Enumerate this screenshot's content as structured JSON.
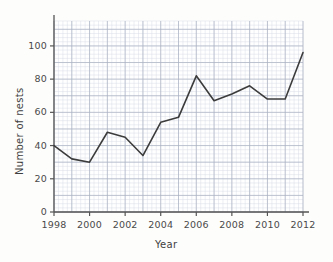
{
  "chart_data": {
    "type": "line",
    "title": "",
    "xlabel": "Year",
    "ylabel": "Number of nests",
    "x": [
      1998,
      1999,
      2000,
      2001,
      2002,
      2003,
      2004,
      2005,
      2006,
      2007,
      2008,
      2009,
      2010,
      2011,
      2012
    ],
    "values": [
      40,
      32,
      30,
      48,
      45,
      34,
      54,
      57,
      82,
      67,
      71,
      76,
      68,
      68,
      96
    ],
    "series": [
      {
        "name": "Number of nests",
        "values": [
          40,
          32,
          30,
          48,
          45,
          34,
          54,
          57,
          82,
          67,
          71,
          76,
          68,
          68,
          96
        ]
      }
    ],
    "xlim": [
      1998,
      2012
    ],
    "ylim": [
      0,
      115
    ],
    "xticks": [
      1998,
      2000,
      2002,
      2004,
      2006,
      2008,
      2010,
      2012
    ],
    "xtick_labels": [
      "1998",
      "2000",
      "2002",
      "2004",
      "2006",
      "2008",
      "2010",
      "2012"
    ],
    "yticks": [
      0,
      20,
      40,
      60,
      80,
      100
    ],
    "ytick_labels": [
      "0",
      "20",
      "40",
      "60",
      "80",
      "100"
    ],
    "grid": true,
    "grid_style": "graph-paper",
    "grid_minor_step_x": 0.25,
    "grid_minor_step_y": 2.5,
    "grid_major_step_x": 1,
    "grid_major_step_y": 10,
    "legend": null,
    "legend_position": "none",
    "colors": {
      "line": "#3c3c3c",
      "axis": "#555555",
      "grid_minor": "#d8dce6",
      "grid_major": "#a9b0c2",
      "background": "#fdfdfb",
      "text": "#444444"
    },
    "line_width": 1.6,
    "markers": "none"
  }
}
